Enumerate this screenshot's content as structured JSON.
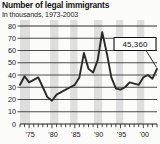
{
  "header": {
    "title": "Number of legal immigrants",
    "subtitle": "In thousands, 1973-2003"
  },
  "callout": {
    "value": "45,360"
  },
  "chart_data": {
    "type": "line",
    "title": "Number of legal immigrants",
    "subtitle": "In thousands, 1973-2003",
    "xlabel": "",
    "ylabel": "In thousands",
    "ylim": [
      0,
      80
    ],
    "xlim": [
      1973,
      2003
    ],
    "yticks": [
      0,
      10,
      20,
      30,
      40,
      50,
      60,
      70,
      80
    ],
    "ytick_labels": [
      "0",
      "10",
      "20",
      "30",
      "40",
      "50",
      "60",
      "70",
      "80"
    ],
    "xtick_labels": [
      "'75",
      "'80",
      "'85",
      "'90",
      "'95",
      "'00"
    ],
    "xtick_label_years": [
      1975,
      1980,
      1985,
      1990,
      1995,
      2000
    ],
    "grid": true,
    "grid_orientation": "horizontal",
    "annotation_label": "45,360",
    "annotation_year": 2003,
    "annotation_value": 45.36,
    "line_color": "#2a2a2a",
    "band_color": "#d8d8d8",
    "x": [
      1973,
      1974,
      1975,
      1976,
      1977,
      1978,
      1979,
      1980,
      1981,
      1982,
      1983,
      1984,
      1985,
      1986,
      1987,
      1988,
      1989,
      1990,
      1991,
      1992,
      1993,
      1994,
      1995,
      1996,
      1997,
      1998,
      1999,
      2000,
      2001,
      2002,
      2003
    ],
    "values": [
      32,
      39,
      34,
      36,
      38,
      30,
      22,
      19,
      24,
      26,
      28,
      30,
      32,
      38,
      58,
      45,
      42,
      52,
      75,
      58,
      38,
      29,
      28,
      30,
      34,
      33,
      32,
      38,
      40,
      37,
      45
    ]
  }
}
